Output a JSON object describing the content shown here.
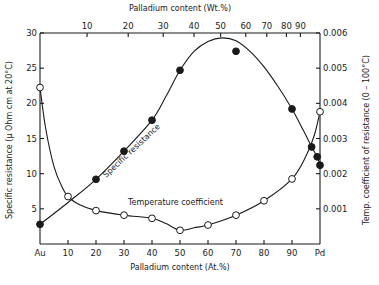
{
  "chart_data": {
    "type": "line",
    "title": "",
    "x": {
      "label_bottom": "Palladium content (At.%)",
      "label_top": "Palladium content (Wt.%)",
      "range": [
        0,
        100
      ],
      "bottom_ticks": [
        {
          "value": 0,
          "label": "Au"
        },
        {
          "value": 10,
          "label": "10"
        },
        {
          "value": 20,
          "label": "20"
        },
        {
          "value": 30,
          "label": "30"
        },
        {
          "value": 40,
          "label": "40"
        },
        {
          "value": 50,
          "label": "50"
        },
        {
          "value": 60,
          "label": "60"
        },
        {
          "value": 70,
          "label": "70"
        },
        {
          "value": 80,
          "label": "80"
        },
        {
          "value": 90,
          "label": "90"
        },
        {
          "value": 100,
          "label": "Pd"
        }
      ],
      "top_ticks": [
        {
          "at_pos": 16.8,
          "label": "10"
        },
        {
          "at_pos": 31.5,
          "label": "20"
        },
        {
          "at_pos": 44.0,
          "label": "30"
        },
        {
          "at_pos": 55.0,
          "label": "40"
        },
        {
          "at_pos": 64.5,
          "label": "50"
        },
        {
          "at_pos": 73.5,
          "label": "60"
        },
        {
          "at_pos": 81.0,
          "label": "70"
        },
        {
          "at_pos": 88.0,
          "label": "80"
        },
        {
          "at_pos": 93.0,
          "label": "90"
        }
      ]
    },
    "y_left": {
      "label": "Specific resistance (μ Ohm cm at 20°C)",
      "range": [
        0,
        30
      ],
      "ticks": [
        5,
        10,
        15,
        20,
        25,
        30
      ]
    },
    "y_right": {
      "label": "Temp. coefficient of resistance (0 – 100°C)",
      "range": [
        0,
        0.006
      ],
      "ticks": [
        "0.001",
        "0.002",
        "0.003",
        "0.004",
        "0.005",
        "0.006"
      ]
    },
    "series": [
      {
        "name": "Specific resistance",
        "axis": "left",
        "marker": "filled-circle",
        "points": [
          [
            0,
            2.8
          ],
          [
            20,
            9.2
          ],
          [
            30,
            13.2
          ],
          [
            40,
            17.6
          ],
          [
            50,
            24.7
          ],
          [
            70,
            27.4
          ],
          [
            90,
            19.2
          ],
          [
            97,
            13.8
          ],
          [
            99,
            12.4
          ],
          [
            100,
            11.2
          ]
        ],
        "curve": [
          [
            0,
            2.8
          ],
          [
            10,
            5.9
          ],
          [
            20,
            9.2
          ],
          [
            30,
            13.2
          ],
          [
            40,
            17.6
          ],
          [
            45,
            21.0
          ],
          [
            50,
            24.7
          ],
          [
            55,
            27.4
          ],
          [
            60,
            28.8
          ],
          [
            65,
            29.3
          ],
          [
            70,
            28.9
          ],
          [
            75,
            27.4
          ],
          [
            80,
            25.2
          ],
          [
            85,
            22.4
          ],
          [
            90,
            19.2
          ],
          [
            94,
            16.2
          ],
          [
            97,
            13.8
          ],
          [
            99,
            12.4
          ],
          [
            100,
            11.2
          ]
        ]
      },
      {
        "name": "Temperature coefficient",
        "axis": "right",
        "marker": "open-circle",
        "points": [
          [
            0,
            0.00445
          ],
          [
            10,
            0.00135
          ],
          [
            20,
            0.00095
          ],
          [
            30,
            0.00082
          ],
          [
            40,
            0.00073
          ],
          [
            50,
            0.00039
          ],
          [
            60,
            0.00054
          ],
          [
            70,
            0.00082
          ],
          [
            80,
            0.00123
          ],
          [
            90,
            0.00185
          ],
          [
            100,
            0.00376
          ]
        ],
        "curve": [
          [
            0,
            0.00445
          ],
          [
            2,
            0.0033
          ],
          [
            5,
            0.0022
          ],
          [
            8,
            0.0016
          ],
          [
            10,
            0.00135
          ],
          [
            14,
            0.00112
          ],
          [
            20,
            0.00095
          ],
          [
            30,
            0.00082
          ],
          [
            40,
            0.00073
          ],
          [
            45,
            0.00058
          ],
          [
            50,
            0.00039
          ],
          [
            55,
            0.00046
          ],
          [
            60,
            0.00054
          ],
          [
            70,
            0.00082
          ],
          [
            80,
            0.00123
          ],
          [
            90,
            0.00185
          ],
          [
            95,
            0.0025
          ],
          [
            98,
            0.0031
          ],
          [
            100,
            0.00376
          ]
        ]
      }
    ],
    "annotations": [
      {
        "text": "Specific resistance",
        "rotated": true
      },
      {
        "text": "Temperature coefficient"
      }
    ],
    "grid": false,
    "legend": "none"
  }
}
